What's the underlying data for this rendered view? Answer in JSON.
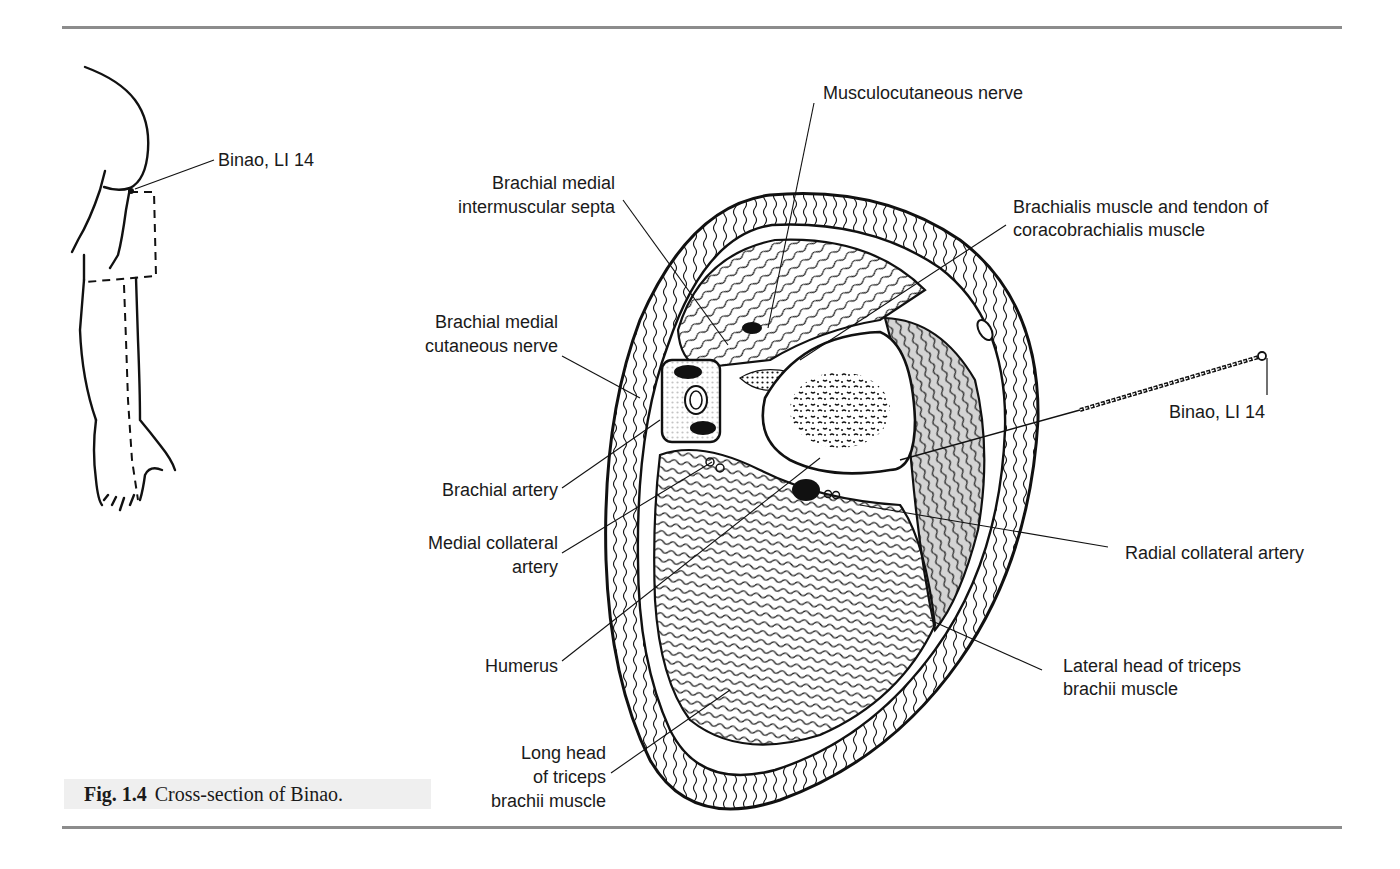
{
  "figure": {
    "number": "Fig. 1.4",
    "caption": "Cross-section of Binao."
  },
  "arm_diagram": {
    "point_label": "Binao, LI 14"
  },
  "cross_section": {
    "labels": {
      "musculocutaneous_nerve": "Musculocutaneous nerve",
      "brachial_medial_intermuscular_septa_1": "Brachial medial",
      "brachial_medial_intermuscular_septa_2": "intermuscular septa",
      "brachialis_1": "Brachialis muscle and tendon of",
      "brachialis_2": "coracobrachialis muscle",
      "brachial_medial_cutaneous_nerve_1": "Brachial medial",
      "brachial_medial_cutaneous_nerve_2": "cutaneous nerve",
      "needle_point": "Binao, LI 14",
      "brachial_artery": "Brachial artery",
      "medial_collateral_artery_1": "Medial collateral",
      "medial_collateral_artery_2": "artery",
      "radial_collateral_artery": "Radial collateral artery",
      "humerus": "Humerus",
      "lateral_head_1": "Lateral head of triceps",
      "lateral_head_2": "brachii muscle",
      "long_head_1": "Long head",
      "long_head_2": "of triceps",
      "long_head_3": "brachii muscle"
    }
  },
  "colors": {
    "ink": "#111111",
    "rule": "#8c8c8c",
    "caption_bg": "#efefef",
    "shaded_muscle": "#d4d4d4"
  }
}
